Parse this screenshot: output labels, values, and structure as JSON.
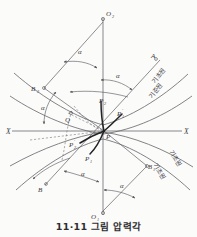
{
  "figure": {
    "caption": "11·11 그림 압력각",
    "background_color": "#fbfbfa",
    "line_color": "#5b5b60",
    "emphasis_color": "#232326"
  },
  "axes": {
    "x_left_label": "X",
    "x_right_label": "X",
    "vertical_top_label": "O",
    "vertical_top_sub": "2",
    "vertical_bottom_label": "O",
    "vertical_bottom_sub": "1"
  },
  "points": [
    {
      "name": "center-pitch-point",
      "label": "P",
      "sub": "",
      "prime": "",
      "x": 104,
      "y": 132
    },
    {
      "name": "point-p2",
      "label": "P",
      "sub": "2",
      "prime": "",
      "x": 102,
      "y": 105
    },
    {
      "name": "point-p1-prime",
      "label": "P",
      "sub": "1",
      "prime": "′",
      "x": 119,
      "y": 113
    },
    {
      "name": "point-p2-prime",
      "label": "P",
      "sub": "2",
      "prime": "′",
      "x": 74,
      "y": 142
    },
    {
      "name": "point-p1",
      "label": "P",
      "sub": "1",
      "prime": "",
      "x": 89,
      "y": 156
    },
    {
      "name": "point-q",
      "label": "Q",
      "sub": "",
      "prime": "",
      "x": 68,
      "y": 118
    },
    {
      "name": "point-b2",
      "label": "B",
      "sub": "2",
      "prime": "",
      "x": 40,
      "y": 89
    },
    {
      "name": "point-b1",
      "label": "B",
      "sub": "1",
      "prime": "",
      "x": 144,
      "y": 164
    },
    {
      "name": "point-a",
      "label": "A",
      "sub": "",
      "prime": "",
      "x": 153,
      "y": 62
    },
    {
      "name": "point-b",
      "label": "B",
      "sub": "",
      "prime": "",
      "x": 40,
      "y": 190
    }
  ],
  "angle_labels": [
    {
      "name": "alpha-upper-left",
      "text": "α",
      "x": 80,
      "y": 51
    },
    {
      "name": "alpha-upper-right",
      "text": "α",
      "x": 119,
      "y": 75
    },
    {
      "name": "alpha-mid-left",
      "text": "α",
      "x": 44,
      "y": 107
    },
    {
      "name": "alpha-lower-left",
      "text": "α",
      "x": 84,
      "y": 173
    },
    {
      "name": "alpha-lower-right",
      "text": "α",
      "x": 112,
      "y": 185
    }
  ],
  "circle_labels": [
    {
      "name": "base-circle-upper-right",
      "text": "기초원",
      "x": 162,
      "y": 86,
      "rotate": -52
    },
    {
      "name": "pitch-circle-upper-right",
      "text": "기준원",
      "x": 160,
      "y": 100,
      "rotate": -52
    },
    {
      "name": "base-circle-lower-right",
      "text": "기초원",
      "x": 176,
      "y": 157,
      "rotate": 58
    },
    {
      "name": "pitch-circle-lower-right",
      "text": "기초원",
      "x": 161,
      "y": 170,
      "rotate": 58
    }
  ],
  "legend": {
    "base_circle_term": "기초원",
    "pitch_circle_term": "기준원"
  }
}
